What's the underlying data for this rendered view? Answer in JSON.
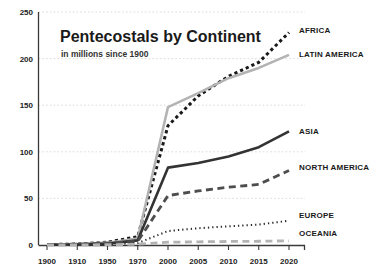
{
  "chart_data": {
    "type": "line",
    "title": "Pentecostals by Continent",
    "subtitle": "in millions since 1900",
    "xlabel": "",
    "ylabel": "",
    "ylim": [
      0,
      250
    ],
    "yticks": [
      0,
      50,
      100,
      150,
      200,
      250
    ],
    "grid": true,
    "legend_position": "right-inline",
    "categories": [
      "1900",
      "1910",
      "1950",
      "1970",
      "2000",
      "2005",
      "2010",
      "2015",
      "2020"
    ],
    "series": [
      {
        "name": "AFRICA",
        "label": "AFRICA",
        "color": "#1a1a1a",
        "style": "dotted-thick",
        "values": [
          0.5,
          1,
          3,
          9,
          128,
          160,
          181,
          196,
          228
        ],
        "label_value": 228
      },
      {
        "name": "LATIN AMERICA",
        "label": "LATIN AMERICA",
        "color": "#b3b3b3",
        "style": "solid",
        "values": [
          0.3,
          0.8,
          2.5,
          7,
          148,
          163,
          179,
          190,
          204
        ],
        "label_value": 204
      },
      {
        "name": "ASIA",
        "label": "ASIA",
        "color": "#333333",
        "style": "solid",
        "values": [
          0.2,
          0.5,
          1.5,
          5,
          83,
          88,
          95,
          105,
          122
        ],
        "label_value": 122
      },
      {
        "name": "NORTH AMERICA",
        "label": "NORTH AMERICA",
        "color": "#4d4d4d",
        "style": "dashed",
        "values": [
          0.4,
          0.9,
          2,
          4,
          53,
          58,
          62,
          65,
          80
        ],
        "label_value": 80
      },
      {
        "name": "EUROPE",
        "label": "EUROPE",
        "color": "#2b2b2b",
        "style": "fine-dotted",
        "values": [
          0.2,
          0.3,
          0.8,
          2,
          15,
          18,
          20,
          22,
          26
        ],
        "label_value": 26
      },
      {
        "name": "OCEANIA",
        "label": "OCEANIA",
        "color": "#b3b3b3",
        "style": "dashed",
        "values": [
          0.05,
          0.1,
          0.3,
          0.8,
          3,
          3.4,
          3.8,
          4,
          4.5
        ],
        "label_value": 4.5
      }
    ],
    "label_positions": {
      "AFRICA": 33,
      "LATIN AMERICA": 57,
      "ASIA": 134,
      "NORTH AMERICA": 170,
      "EUROPE": 218,
      "OCEANIA": 236
    }
  }
}
